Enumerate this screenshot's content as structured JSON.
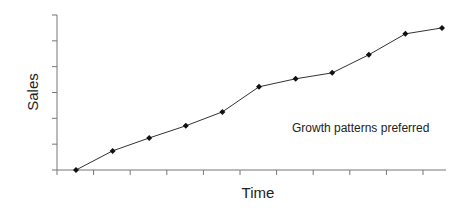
{
  "chart_data": {
    "type": "line",
    "title": "",
    "xlabel": "Time",
    "ylabel": "Sales",
    "annotation": "Growth patterns preferred",
    "x_tick_labels": [],
    "y_tick_labels": [],
    "x": [
      1,
      2,
      3,
      4,
      5,
      6,
      7,
      8,
      9,
      10,
      11
    ],
    "values": [
      0,
      0.74,
      1.24,
      1.71,
      2.25,
      3.22,
      3.53,
      3.76,
      4.46,
      5.27,
      5.5
    ],
    "ylim": [
      0,
      6
    ],
    "y_ticks_count": 7,
    "x_ticks_count": 11,
    "grid": false,
    "legend": null,
    "marker": "diamond",
    "line_color": "#333333",
    "marker_color": "#111111",
    "axis_color": "#777777"
  }
}
